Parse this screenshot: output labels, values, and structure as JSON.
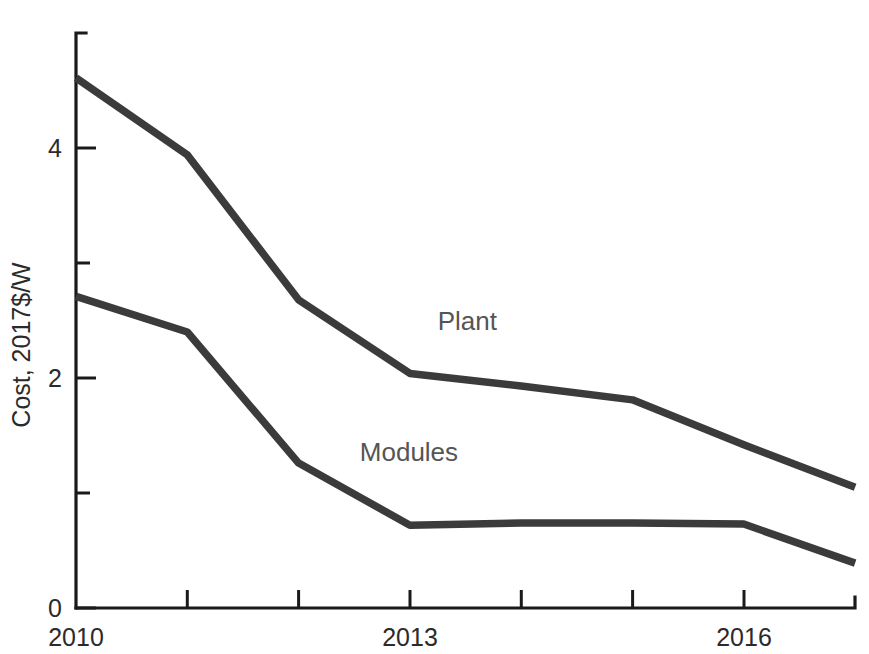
{
  "chart_data": {
    "type": "line",
    "title": "",
    "xlabel": "",
    "ylabel": "Cost, 2017$/W",
    "xlim": [
      2010,
      2017
    ],
    "ylim": [
      0,
      5
    ],
    "grid": false,
    "legend_position": "inline-annotations",
    "x": [
      2010,
      2011,
      2012,
      2013,
      2014,
      2015,
      2016,
      2017
    ],
    "xtick_values": [
      2010,
      2011,
      2012,
      2013,
      2014,
      2015,
      2016,
      2017
    ],
    "xtick_labels": [
      "2010",
      "",
      "",
      "2013",
      "",
      "",
      "2016",
      ""
    ],
    "ytick_values": [
      0,
      1,
      2,
      3,
      4
    ],
    "ytick_labels": [
      "0",
      "",
      "2",
      "",
      "4"
    ],
    "series": [
      {
        "name": "Plant",
        "values": [
          4.61,
          3.94,
          2.68,
          2.04,
          1.93,
          1.81,
          1.42,
          1.05
        ],
        "color": "#3b3b3b",
        "label_x": 2013.25,
        "label_y": 2.42
      },
      {
        "name": "Modules",
        "values": [
          2.71,
          2.4,
          1.26,
          0.72,
          0.74,
          0.74,
          0.73,
          0.39
        ],
        "color": "#3b3b3b",
        "label_x": 2012.55,
        "label_y": 1.28
      }
    ],
    "annotations": [
      {
        "text": "Plant",
        "x": 2013.25,
        "y": 2.42
      },
      {
        "text": "Modules",
        "x": 2012.55,
        "y": 1.28
      }
    ]
  },
  "axis": {
    "y_title": "Cost, 2017$/W",
    "y_labels": {
      "zero": "0",
      "two": "2",
      "four": "4"
    },
    "x_labels": {
      "start": "2010",
      "mid": "2013",
      "end": "2016"
    }
  },
  "labels": {
    "plant": "Plant",
    "modules": "Modules"
  },
  "colors": {
    "line": "#3b3b3b",
    "axis": "#1a1a1a",
    "annotation": "#555555",
    "background": "#ffffff"
  }
}
